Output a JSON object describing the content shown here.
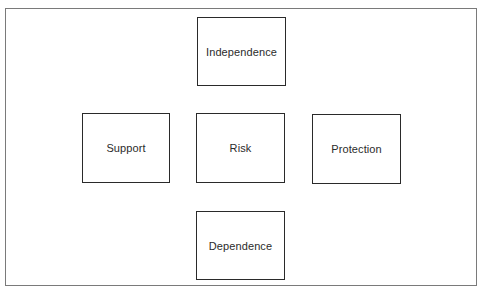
{
  "diagram": {
    "type": "cross-layout concept diagram",
    "frame_color": "#7a7a7a",
    "box_border_color": "#2a2a2a",
    "text_color": "#2b2b2b",
    "nodes": {
      "top": {
        "label": "Independence"
      },
      "left": {
        "label": "Support"
      },
      "center": {
        "label": "Risk"
      },
      "right": {
        "label": "Protection"
      },
      "bottom": {
        "label": "Dependence"
      }
    }
  }
}
